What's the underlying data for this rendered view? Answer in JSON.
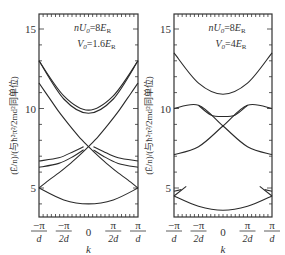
{
  "chart_data": [
    {
      "type": "line",
      "title": "",
      "annotation": [
        "nU₀=8Eᴿ",
        "V₀=1.6Eᴿ"
      ],
      "annotation_parts": {
        "line1": {
          "a": "nU",
          "sub": "0",
          "b": "=8E",
          "sub2": "R"
        },
        "line2": {
          "a": "V",
          "sub": "0",
          "b": "=1.6E",
          "sub2": "R"
        }
      },
      "xlabel": "k",
      "ylabel": "(Ẽ/n)/(与ħ²π²/2md²同单位)",
      "xticks": [
        "-π/d",
        "-π/2d",
        "0",
        "π/2d",
        "π/d"
      ],
      "yticks": [
        5,
        10,
        15
      ],
      "xlim": [
        -1,
        1
      ],
      "ylim": [
        3.2,
        15.9
      ],
      "series": [
        {
          "name": "band1",
          "x": [
            -1,
            -0.5,
            0,
            0.5,
            1
          ],
          "y": [
            5.0,
            4.25,
            4.0,
            4.25,
            5.0
          ]
        },
        {
          "name": "band2-left",
          "x": [
            -1,
            -0.8,
            -0.6,
            -0.4,
            -0.2,
            0,
            0.2,
            0.4,
            0.6,
            0.8,
            1
          ],
          "y": [
            5.0,
            5.5,
            5.95,
            6.45,
            7.0,
            7.6,
            8.25,
            9.0,
            9.8,
            10.7,
            11.6
          ]
        },
        {
          "name": "band2-right",
          "x": [
            -1,
            -0.8,
            -0.6,
            -0.4,
            -0.2,
            0,
            0.2,
            0.4,
            0.6,
            0.8,
            1
          ],
          "y": [
            11.6,
            10.7,
            9.8,
            9.0,
            8.25,
            7.6,
            7.0,
            6.45,
            5.95,
            5.5,
            5.0
          ]
        },
        {
          "name": "band3a",
          "x": [
            -1,
            -0.6,
            -0.3,
            -0.1
          ],
          "y": [
            6.7,
            6.9,
            7.3,
            7.6
          ]
        },
        {
          "name": "band3b",
          "x": [
            -1,
            -0.6,
            -0.3,
            -0.1
          ],
          "y": [
            6.3,
            6.55,
            7.0,
            7.4
          ]
        },
        {
          "name": "band3a-r",
          "x": [
            0.1,
            0.3,
            0.6,
            1
          ],
          "y": [
            7.6,
            7.3,
            6.9,
            6.7
          ]
        },
        {
          "name": "band3b-r",
          "x": [
            0.1,
            0.3,
            0.6,
            1
          ],
          "y": [
            7.4,
            7.0,
            6.55,
            6.3
          ]
        },
        {
          "name": "band4a",
          "x": [
            -1,
            -0.5,
            0,
            0.5,
            1
          ],
          "y": [
            13.0,
            10.8,
            9.9,
            10.8,
            13.0
          ]
        },
        {
          "name": "band4b",
          "x": [
            -1,
            -0.5,
            0,
            0.5,
            1
          ],
          "y": [
            13.0,
            10.6,
            9.7,
            10.6,
            13.0
          ]
        }
      ]
    },
    {
      "type": "line",
      "title": "",
      "annotation": [
        "nU₀=8Eᴿ",
        "V₀=4Eᴿ"
      ],
      "annotation_parts": {
        "line1": {
          "a": "nU",
          "sub": "0",
          "b": "=8E",
          "sub2": "R"
        },
        "line2": {
          "a": "V",
          "sub": "0",
          "b": "=4E",
          "sub2": "R"
        }
      },
      "xlabel": "k",
      "ylabel": "(Ẽ/n)/(与ħ²π²/2md²同单位)",
      "xticks": [
        "-π/d",
        "-π/2d",
        "0",
        "π/2d",
        "π/d"
      ],
      "yticks": [
        5,
        10,
        15
      ],
      "xlim": [
        -1,
        1
      ],
      "ylim": [
        3.2,
        15.9
      ],
      "series": [
        {
          "name": "band1",
          "x": [
            -1,
            -0.5,
            0,
            0.5,
            1
          ],
          "y": [
            4.5,
            3.85,
            3.6,
            3.85,
            4.5
          ]
        },
        {
          "name": "band1-edge-l",
          "x": [
            -1,
            -0.75
          ],
          "y": [
            4.5,
            5.1
          ]
        },
        {
          "name": "band1-edge-l2",
          "x": [
            -1,
            -0.85
          ],
          "y": [
            4.8,
            4.9
          ]
        },
        {
          "name": "band1-edge-r",
          "x": [
            0.75,
            1
          ],
          "y": [
            5.1,
            4.5
          ]
        },
        {
          "name": "band1-edge-r2",
          "x": [
            0.85,
            1
          ],
          "y": [
            4.9,
            4.8
          ]
        },
        {
          "name": "band2",
          "x": [
            -1,
            -0.5,
            0,
            0.5,
            1
          ],
          "y": [
            7.1,
            7.6,
            8.9,
            10.2,
            10.0
          ]
        },
        {
          "name": "band2-mirror",
          "x": [
            -1,
            -0.5,
            0,
            0.5,
            1
          ],
          "y": [
            10.0,
            10.2,
            8.9,
            7.6,
            7.1
          ]
        },
        {
          "name": "band3",
          "x": [
            -0.5,
            -0.25,
            0,
            0.25,
            0.5
          ],
          "y": [
            10.2,
            9.6,
            9.5,
            9.6,
            10.2
          ]
        },
        {
          "name": "band4",
          "x": [
            -1,
            -0.5,
            0,
            0.5,
            1
          ],
          "y": [
            13.5,
            11.6,
            10.9,
            11.6,
            13.5
          ]
        }
      ]
    }
  ],
  "panels": [
    {
      "x0": 39,
      "x1": 138
    },
    {
      "x0": 174,
      "x1": 272
    }
  ],
  "axis": {
    "y_top_px": 14,
    "y_bottom_px": 217,
    "e_at_5_px": 188,
    "px_per_unit": 15.9
  }
}
